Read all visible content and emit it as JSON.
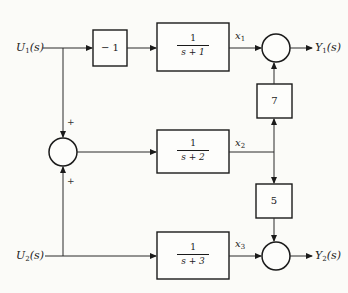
{
  "diagram": {
    "type": "block-diagram",
    "inputs": [
      {
        "id": "U1",
        "label": "U",
        "sub": "1",
        "arg": "(s)"
      },
      {
        "id": "U2",
        "label": "U",
        "sub": "2",
        "arg": "(s)"
      }
    ],
    "outputs": [
      {
        "id": "Y1",
        "label": "Y",
        "sub": "1",
        "arg": "(s)"
      },
      {
        "id": "Y2",
        "label": "Y",
        "sub": "2",
        "arg": "(s)"
      }
    ],
    "blocks": [
      {
        "id": "gain_neg1",
        "text": "− 1"
      },
      {
        "id": "tf1",
        "num": "1",
        "den": "s + 1"
      },
      {
        "id": "tf2",
        "num": "1",
        "den": "s + 2"
      },
      {
        "id": "tf3",
        "num": "1",
        "den": "s + 3"
      },
      {
        "id": "gain7",
        "text": "7"
      },
      {
        "id": "gain5",
        "text": "5"
      }
    ],
    "states": [
      {
        "id": "x1",
        "label": "x",
        "sub": "1"
      },
      {
        "id": "x2",
        "label": "x",
        "sub": "2"
      },
      {
        "id": "x3",
        "label": "x",
        "sub": "3"
      }
    ],
    "summing_junctions": [
      {
        "id": "sum_mid",
        "signs": [
          "+",
          "+"
        ]
      },
      {
        "id": "sum_y1",
        "signs": []
      },
      {
        "id": "sum_y2",
        "signs": []
      }
    ],
    "connections": [
      "U1 -> gain_neg1",
      "gain_neg1 -> tf1",
      "tf1 -> x1",
      "x1 -> sum_y1",
      "sum_y1 -> Y1",
      "U1 -> sum_mid (+)",
      "U2 -> sum_mid (+)",
      "sum_mid -> tf2",
      "tf2 -> x2",
      "x2 -> gain7",
      "gain7 -> sum_y1",
      "x2 -> gain5",
      "gain5 -> sum_y2",
      "U2 -> tf3",
      "tf3 -> x3",
      "x3 -> sum_y2",
      "sum_y2 -> Y2"
    ],
    "signs": {
      "plus_top": "+",
      "plus_bottom": "+"
    }
  }
}
